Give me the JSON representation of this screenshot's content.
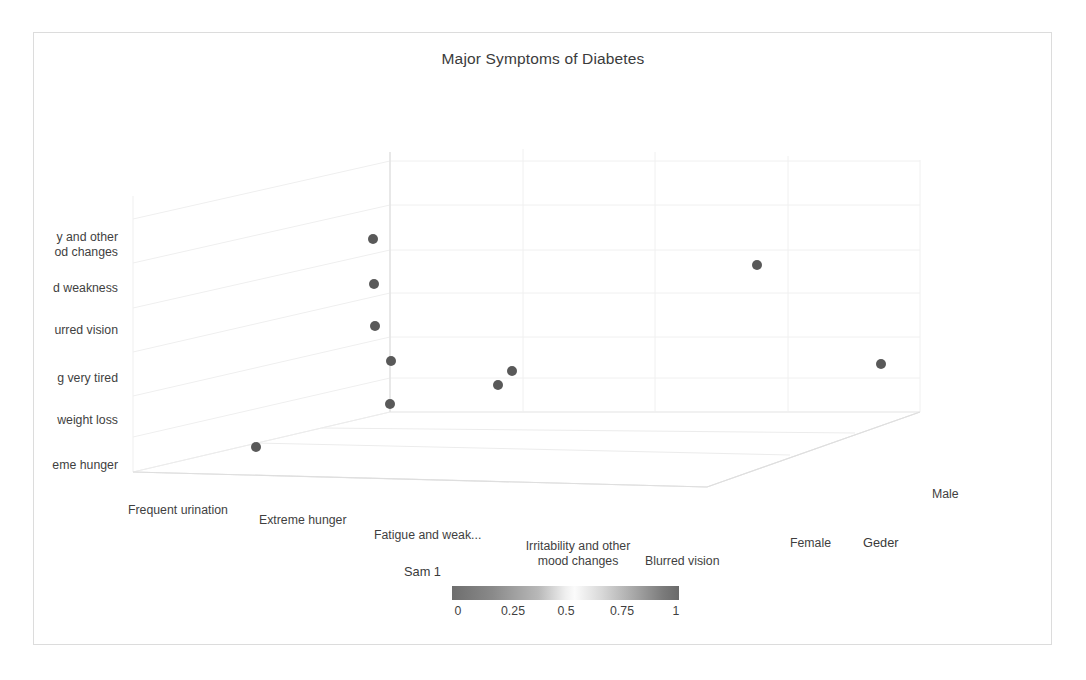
{
  "figure": {
    "title": "Major Symptoms of Diabetes",
    "background_color": "#ffffff",
    "border_color": "#dcdcdc",
    "marker_color": "#595959",
    "text_color": "#3f3f3f"
  },
  "chart_data": {
    "type": "scatter",
    "projection": "3d",
    "title": "Major Symptoms of Diabetes",
    "xlabel": "Sam 1",
    "ylabel": "",
    "zlabel": "Geder",
    "grid": true,
    "legend": "none",
    "x_tick_labels": [
      "Frequent urination",
      "Extreme hunger",
      "Fatigue and weak...",
      "Irritability and other\nmood changes",
      "Blurred vision"
    ],
    "y_tick_labels": [
      "Irritability and other\nmood changes",
      "Fatigue and weakness",
      "Blurred vision",
      "Feeling very tired",
      "Unusual weight loss",
      "Extreme hunger"
    ],
    "y_tick_labels_clipped": [
      "y and other\nod changes",
      "d weakness",
      "urred vision",
      "g very tired",
      "weight loss",
      "eme hunger"
    ],
    "z_tick_labels": [
      "Female",
      "Male"
    ],
    "points": [
      {
        "x": "Extreme hunger",
        "y": "Extreme hunger",
        "z": "Female",
        "value": 0.5,
        "px": 256,
        "py": 447
      },
      {
        "x": "Fatigue and weak...",
        "y": "Unusual weight loss",
        "z": "Female",
        "value": 0.5,
        "px": 390,
        "py": 404
      },
      {
        "x": "Fatigue and weak...",
        "y": "Feeling very tired",
        "z": "Female",
        "value": 0.5,
        "px": 391,
        "py": 361
      },
      {
        "x": "Fatigue and weak...",
        "y": "Blurred vision",
        "z": "Female",
        "value": 0.5,
        "px": 375,
        "py": 326
      },
      {
        "x": "Fatigue and weak...",
        "y": "Fatigue and weakness",
        "z": "Female",
        "value": 0.5,
        "px": 374,
        "py": 284
      },
      {
        "x": "Fatigue and weak...",
        "y": "Irritability and other mood changes",
        "z": "Female",
        "value": 0.5,
        "px": 373,
        "py": 239
      },
      {
        "x": "Irritability and other mood changes",
        "y": "Feeling very tired",
        "z": "Female",
        "value": 0.5,
        "px": 498,
        "py": 385
      },
      {
        "x": "Irritability and other mood changes",
        "y": "Feeling very tired",
        "z": "Female",
        "value": 0.5,
        "px": 512,
        "py": 371
      },
      {
        "x": "Blurred vision",
        "y": "Irritability and other mood changes",
        "z": "Male",
        "value": 0.5,
        "px": 757,
        "py": 265
      },
      {
        "x": "Blurred vision",
        "y": "Feeling very tired",
        "z": "Male",
        "value": 0.5,
        "px": 881,
        "py": 364
      }
    ],
    "colorbar": {
      "orientation": "horizontal",
      "ticks": [
        "0",
        "0.25",
        "0.5",
        "0.75",
        "1"
      ],
      "tick_values": [
        0,
        0.25,
        0.5,
        0.75,
        1
      ],
      "vmin": 0,
      "vmax": 1
    }
  },
  "y_axis": {
    "labels": [
      {
        "text": "y and other\nod changes",
        "top": 230
      },
      {
        "text": "d weakness",
        "top": 281
      },
      {
        "text": "urred vision",
        "top": 323
      },
      {
        "text": "g very tired",
        "top": 371
      },
      {
        "text": "weight loss",
        "top": 413
      },
      {
        "text": "eme hunger",
        "top": 458
      }
    ]
  },
  "x_axis": {
    "title": "Sam 1",
    "labels": [
      {
        "text": "Frequent urination",
        "left": 128,
        "top": 503
      },
      {
        "text": "Extreme hunger",
        "left": 259,
        "top": 513
      },
      {
        "text": "Fatigue and weak...",
        "left": 374,
        "top": 528
      },
      {
        "text": "Irritability and other\nmood changes",
        "left": 498,
        "top": 540
      },
      {
        "text": "Blurred vision",
        "left": 645,
        "top": 554
      }
    ]
  },
  "z_axis": {
    "title": "Geder",
    "labels": [
      {
        "text": "Male",
        "left": 932,
        "top": 488
      },
      {
        "text": "Female",
        "left": 790,
        "top": 537
      }
    ]
  },
  "colorbar": {
    "ticks": [
      {
        "text": "0",
        "left": 458
      },
      {
        "text": "0.25",
        "left": 513
      },
      {
        "text": "0.5",
        "left": 566
      },
      {
        "text": "0.75",
        "left": 622
      },
      {
        "text": "1",
        "left": 676
      }
    ]
  }
}
